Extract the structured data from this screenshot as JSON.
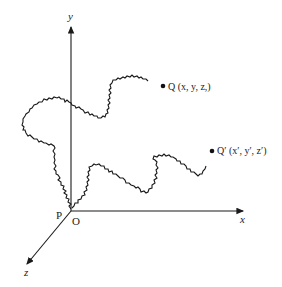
{
  "figure": {
    "type": "random-walk-3d-axes",
    "axes": {
      "x_label": "x",
      "y_label": "y",
      "z_label": "z"
    },
    "origin_label": "O",
    "start_point_label": "P",
    "points": [
      {
        "id": "Q",
        "label": "Q (x, y, z,)"
      },
      {
        "id": "Q_prime",
        "label": "Q′ (x′, y′, z′)"
      }
    ],
    "colors": {
      "ink": "#1a1a1a",
      "background": "#ffffff"
    }
  }
}
